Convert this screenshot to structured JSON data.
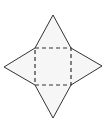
{
  "diagram": {
    "title": "Net of a square pyramid",
    "fill_color": "#f6f6f6",
    "stroke_color": "#333333",
    "background": "#ffffff",
    "square": {
      "style": "dashed",
      "corners": [
        [
          35,
          48
        ],
        [
          71,
          48
        ],
        [
          71,
          85
        ],
        [
          35,
          85
        ]
      ]
    },
    "triangles": [
      {
        "name": "top",
        "apex": [
          53,
          15
        ],
        "base": [
          [
            35,
            48
          ],
          [
            71,
            48
          ]
        ]
      },
      {
        "name": "right",
        "apex": [
          102,
          66
        ],
        "base": [
          [
            71,
            48
          ],
          [
            71,
            85
          ]
        ]
      },
      {
        "name": "bottom",
        "apex": [
          53,
          118
        ],
        "base": [
          [
            71,
            85
          ],
          [
            35,
            85
          ]
        ]
      },
      {
        "name": "left",
        "apex": [
          4,
          67
        ],
        "base": [
          [
            35,
            85
          ],
          [
            35,
            48
          ]
        ]
      }
    ]
  }
}
